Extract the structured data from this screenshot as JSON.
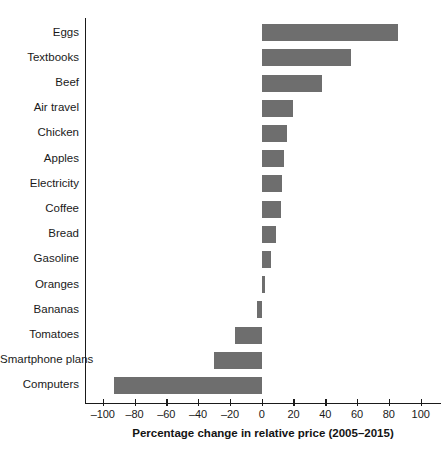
{
  "chart_data": {
    "type": "bar",
    "orientation": "horizontal",
    "title": "",
    "xlabel": "Percentage change in relative price (2005–2015)",
    "ylabel": "",
    "categories": [
      "Eggs",
      "Textbooks",
      "Beef",
      "Air travel",
      "Chicken",
      "Apples",
      "Electricity",
      "Coffee",
      "Bread",
      "Gasoline",
      "Oranges",
      "Bananas",
      "Tomatoes",
      "Smartphone plans",
      "Computers"
    ],
    "values": [
      86,
      56,
      38,
      20,
      16,
      14,
      13,
      12,
      9,
      6,
      2,
      -3,
      -17,
      -30,
      -93
    ],
    "xlim": [
      -100,
      110
    ],
    "xticks": [
      -100,
      -80,
      -60,
      -40,
      -20,
      0,
      20,
      40,
      60,
      80,
      100
    ],
    "xticklabels": [
      "–100",
      "–80",
      "–60",
      "–40",
      "–20",
      "0",
      "20",
      "40",
      "60",
      "80",
      "100"
    ],
    "grid": false,
    "legend": false,
    "bar_color": "#6e6e6e",
    "axis_color": "#1a1a1a",
    "background": "#ffffff"
  }
}
